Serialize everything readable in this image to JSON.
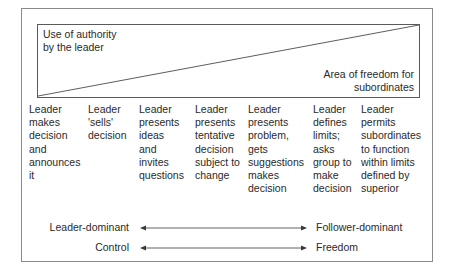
{
  "diagram": {
    "triangle_box": {
      "authority_label": "Use of authority\nby the leader",
      "freedom_label": "Area of freedom for\nsubordinates"
    },
    "behaviours": [
      {
        "label": "Leader\nmakes\ndecision\nand\nannounces\nit"
      },
      {
        "label": "Leader\n'sells'\ndecision"
      },
      {
        "label": "Leader\npresents\nideas\nand\ninvites\nquestions"
      },
      {
        "label": "Leader\npresents\ntentative\ndecision\nsubject to\nchange"
      },
      {
        "label": "Leader\npresents\nproblem,\ngets\nsuggestions\nmakes\ndecision"
      },
      {
        "label": "Leader\ndefines\nlimits;\nasks\ngroup to\nmake\ndecision"
      },
      {
        "label": "Leader\npermits\nsubordinates\nto function\nwithin limits\ndefined by\nsuperior"
      }
    ],
    "scales": [
      {
        "left": "Leader-dominant",
        "right": "Follower-dominant"
      },
      {
        "left": "Control",
        "right": "Freedom"
      }
    ],
    "colors": {
      "frame": "#8a8a8a",
      "line": "#5a5a5a",
      "text": "#2a2a2a"
    }
  }
}
